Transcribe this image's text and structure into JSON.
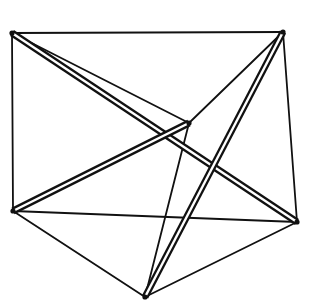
{
  "figure": {
    "stroke_color": "#111111",
    "background": "#ffffff",
    "nodes": [
      {
        "id": "A",
        "x": 12,
        "y": 33
      },
      {
        "id": "B",
        "x": 283,
        "y": 32
      },
      {
        "id": "C",
        "x": 189,
        "y": 123
      },
      {
        "id": "D",
        "x": 13,
        "y": 211
      },
      {
        "id": "E",
        "x": 297,
        "y": 222
      },
      {
        "id": "F",
        "x": 145,
        "y": 297
      }
    ],
    "struts": [
      {
        "from": "A",
        "to": "E"
      },
      {
        "from": "B",
        "to": "F"
      },
      {
        "from": "D",
        "to": "C"
      }
    ],
    "cables": [
      {
        "from": "A",
        "to": "B"
      },
      {
        "from": "A",
        "to": "D"
      },
      {
        "from": "A",
        "to": "C"
      },
      {
        "from": "B",
        "to": "C"
      },
      {
        "from": "B",
        "to": "E"
      },
      {
        "from": "C",
        "to": "F"
      },
      {
        "from": "D",
        "to": "E"
      },
      {
        "from": "D",
        "to": "F"
      },
      {
        "from": "E",
        "to": "F"
      }
    ]
  }
}
